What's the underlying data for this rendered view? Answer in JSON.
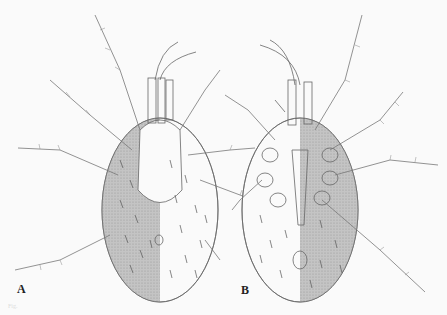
{
  "figure": {
    "panels": [
      {
        "label": "A",
        "view": "dorsal"
      },
      {
        "label": "B",
        "view": "ventral"
      }
    ],
    "caption": "Fig."
  },
  "colors": {
    "background": "#fafafa",
    "ink": "#555555",
    "shading": "#b8b8b8"
  }
}
